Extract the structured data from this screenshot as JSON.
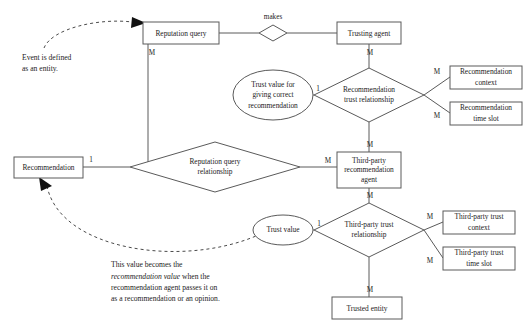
{
  "diagram": {
    "type": "entity-relationship-diagram",
    "colors": {
      "stroke": "#5a5a5a",
      "text": "#1c1c1c",
      "background": "#ffffff",
      "arrow": "#111111"
    },
    "entities": [
      {
        "id": "reputation_query",
        "label": "Reputation query",
        "shape": "rectangle",
        "x": 143,
        "y": 22,
        "w": 76,
        "h": 22
      },
      {
        "id": "trusting_agent",
        "label": "Trusting agent",
        "shape": "rectangle",
        "x": 337,
        "y": 22,
        "w": 64,
        "h": 22
      },
      {
        "id": "recommendation",
        "label": "Recommendation",
        "shape": "rectangle",
        "x": 14,
        "y": 157,
        "w": 69,
        "h": 21
      },
      {
        "id": "third_party_recommendation_agent",
        "label": "Third-party recommendation agent",
        "lines": [
          "Third-party",
          "recommendation",
          "agent"
        ],
        "shape": "rectangle",
        "x": 337,
        "y": 152,
        "w": 64,
        "h": 36
      },
      {
        "id": "trusted_entity",
        "label": "Trusted entity",
        "shape": "rectangle",
        "x": 332,
        "y": 297,
        "w": 70,
        "h": 22
      },
      {
        "id": "recommendation_context",
        "label": "Recommendation context",
        "lines": [
          "Recommendation",
          "context"
        ],
        "shape": "rectangle",
        "x": 450,
        "y": 66,
        "w": 72,
        "h": 23
      },
      {
        "id": "recommendation_time_slot",
        "label": "Recommendation time slot",
        "lines": [
          "Recommendation",
          "time slot"
        ],
        "shape": "rectangle",
        "x": 450,
        "y": 102,
        "w": 72,
        "h": 23
      },
      {
        "id": "third_party_trust_context",
        "label": "Third-party trust context",
        "lines": [
          "Third-party trust",
          "context"
        ],
        "shape": "rectangle",
        "x": 443,
        "y": 211,
        "w": 72,
        "h": 23
      },
      {
        "id": "third_party_trust_time_slot",
        "label": "Third-party trust time slot",
        "lines": [
          "Third-party trust",
          "time slot"
        ],
        "shape": "rectangle",
        "x": 443,
        "y": 247,
        "w": 72,
        "h": 23
      }
    ],
    "attributes": [
      {
        "id": "trust_value_correct_recommendation",
        "label": "Trust value for giving correct recommendation",
        "lines": [
          "Trust value for",
          "giving correct",
          "recommendation"
        ],
        "shape": "ellipse",
        "cx": 273,
        "cy": 95,
        "rx": 40,
        "ry": 25
      },
      {
        "id": "trust_value",
        "label": "Trust value",
        "lines": [
          "Trust value"
        ],
        "shape": "ellipse",
        "cx": 283,
        "cy": 230,
        "rx": 30,
        "ry": 15
      }
    ],
    "relationships": [
      {
        "id": "makes",
        "label": "makes",
        "shape": "diamond",
        "cx": 273,
        "cy": 33,
        "rx": 14,
        "ry": 8,
        "label_position": "above"
      },
      {
        "id": "recommendation_trust_relationship",
        "label": "Recommendation trust relationship",
        "lines": [
          "Recommendation",
          "trust relationship"
        ],
        "shape": "diamond",
        "cx": 369,
        "cy": 95,
        "rx": 55,
        "ry": 27,
        "label_position": "inside"
      },
      {
        "id": "reputation_query_relationship",
        "label": "Reputation query relationship",
        "lines": [
          "Reputation query",
          "relationship"
        ],
        "shape": "diamond",
        "cx": 215,
        "cy": 167,
        "rx": 85,
        "ry": 25,
        "label_position": "inside"
      },
      {
        "id": "third_party_trust_relationship",
        "label": "Third-party trust relationship",
        "lines": [
          "Third-party trust",
          "relationship"
        ],
        "shape": "diamond",
        "cx": 369,
        "cy": 230,
        "rx": 55,
        "ry": 27,
        "label_position": "inside"
      }
    ],
    "cardinalities": [
      {
        "id": "card-reputation-query-down",
        "label": "M",
        "x": 152,
        "y": 53
      },
      {
        "id": "card-trusting-agent-down",
        "label": "M",
        "x": 370,
        "y": 53
      },
      {
        "id": "card-trust-value-correct-rec",
        "label": "1",
        "x": 318,
        "y": 89
      },
      {
        "id": "card-recommendation-context",
        "label": "M",
        "x": 437,
        "y": 72
      },
      {
        "id": "card-recommendation-time-slot",
        "label": "M",
        "x": 437,
        "y": 116
      },
      {
        "id": "card-recommendation-left",
        "label": "1",
        "x": 91,
        "y": 160
      },
      {
        "id": "card-tpra-left",
        "label": "M",
        "x": 328,
        "y": 161
      },
      {
        "id": "card-tpra-top",
        "label": "M",
        "x": 370,
        "y": 145
      },
      {
        "id": "card-tpra-bottom",
        "label": "M",
        "x": 370,
        "y": 196
      },
      {
        "id": "card-trust-value",
        "label": "1",
        "x": 319,
        "y": 224
      },
      {
        "id": "card-tp-trust-context",
        "label": "M",
        "x": 430,
        "y": 217
      },
      {
        "id": "card-tp-trust-time-slot",
        "label": "M",
        "x": 430,
        "y": 261
      },
      {
        "id": "card-trusted-entity",
        "label": "M",
        "x": 370,
        "y": 290
      }
    ],
    "annotations": [
      {
        "id": "event-note",
        "lines": [
          "Event is defined",
          "as an entity."
        ],
        "x": 22,
        "y": 56,
        "line_height": 11,
        "target": "reputation_query",
        "connector": "dashed-arrow"
      },
      {
        "id": "recommendation-value-note",
        "lines": [
          "This value becomes the",
          "recommendation value when the",
          "recommendation agent passes it on",
          "as a recommendation or an opinion."
        ],
        "italic_segments": [
          "recommendation value"
        ],
        "x": 111,
        "y": 263,
        "line_height": 11.5,
        "target": "recommendation",
        "connector": "dashed-arrow"
      }
    ]
  }
}
